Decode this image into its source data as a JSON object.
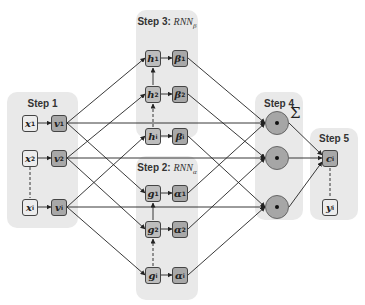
{
  "steps": {
    "step1": {
      "label": "Step 1"
    },
    "step2": {
      "label": "Step 2: ",
      "rnn": "RNN",
      "sub": "α"
    },
    "step3": {
      "label": "Step 3: ",
      "rnn": "RNN",
      "sub": "β"
    },
    "step4": {
      "label": "Step 4",
      "sum_symbol": "Σ"
    },
    "step5": {
      "label": "Step 5"
    }
  },
  "nodes": {
    "x": [
      {
        "base": "x",
        "sub": "1"
      },
      {
        "base": "x",
        "sub": "2"
      },
      {
        "base": "x",
        "sub": "i"
      }
    ],
    "v": [
      {
        "base": "v",
        "sub": "1"
      },
      {
        "base": "v",
        "sub": "2"
      },
      {
        "base": "v",
        "sub": "i"
      }
    ],
    "h": [
      {
        "base": "h",
        "sub": "1"
      },
      {
        "base": "h",
        "sub": "2"
      },
      {
        "base": "h",
        "sub": "i"
      }
    ],
    "beta": [
      {
        "base": "β",
        "sub": "1"
      },
      {
        "base": "β",
        "sub": "2"
      },
      {
        "base": "β",
        "sub": "i"
      }
    ],
    "g": [
      {
        "base": "g",
        "sub": "1"
      },
      {
        "base": "g",
        "sub": "2"
      },
      {
        "base": "g",
        "sub": "i"
      }
    ],
    "alpha": [
      {
        "base": "α",
        "sub": "1"
      },
      {
        "base": "α",
        "sub": "2"
      },
      {
        "base": "α",
        "sub": "i"
      }
    ],
    "c": {
      "base": "c",
      "sub": "i"
    },
    "y": {
      "base": "y",
      "sub": "i"
    }
  },
  "operators": {
    "elementwise": "dot-product-icon"
  },
  "colors": {
    "panel": "#e9e9e9",
    "node_light": "#ececec",
    "node_dark": "#a8a8a8",
    "circle": "#a6a6a6",
    "line": "#222222"
  }
}
